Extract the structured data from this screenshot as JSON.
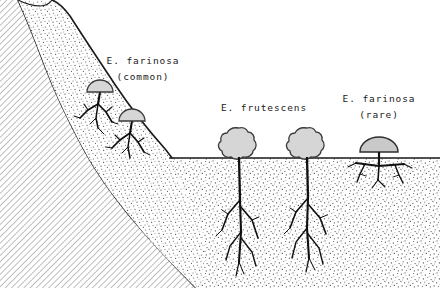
{
  "figure": {
    "width": 440,
    "height": 288,
    "background_color": "#ffffff"
  },
  "colors": {
    "ink": "#1a1a1a",
    "bedrock_hatch": "#8c8c8c",
    "soil_stipple": "#4a4a4a",
    "shrub_fill": "#d6d6d6",
    "shrub_outline": "#3a3a3a",
    "root_color": "#101010",
    "ground_line": "#1a1a1a"
  },
  "labels": [
    {
      "id": "slope-species",
      "species": "E. farinosa",
      "qualifier": "(common)",
      "x": 143,
      "y_species": 61,
      "y_qualifier": 77
    },
    {
      "id": "flat-deep-root-species",
      "species": "E. frutescens",
      "qualifier": "",
      "x": 264,
      "y_species": 108,
      "y_qualifier": 0
    },
    {
      "id": "flat-shallow-root-species",
      "species": "E. farinosa",
      "qualifier": "(rare)",
      "x": 379,
      "y_species": 99,
      "y_qualifier": 115
    }
  ],
  "terrain": {
    "bedrock_label": "bedrock",
    "soil_label": "soil",
    "ground_surface_y": 158,
    "slope_description": "steep rocky slope descending from upper-left to valley floor at right",
    "soil_mantle_thickness_slope": "thin",
    "soil_thickness_flat": "deep"
  },
  "plants": [
    {
      "id": "slope-shrub-upper",
      "species": "E. farinosa",
      "canopy_shape": "dome",
      "root_type": "shallow-branching",
      "cx": 100,
      "cy": 82,
      "rx": 13,
      "ry": 11
    },
    {
      "id": "slope-shrub-lower",
      "species": "E. farinosa",
      "canopy_shape": "dome",
      "root_type": "shallow-branching",
      "cx": 132,
      "cy": 111,
      "rx": 13,
      "ry": 11
    },
    {
      "id": "flat-shrub-left",
      "species": "E. frutescens",
      "canopy_shape": "bushy-round",
      "root_type": "deep-taproot",
      "cx": 239,
      "cy": 142,
      "rx": 17,
      "ry": 15
    },
    {
      "id": "flat-shrub-right",
      "species": "E. frutescens",
      "canopy_shape": "bushy-round",
      "root_type": "deep-taproot",
      "cx": 307,
      "cy": 142,
      "rx": 17,
      "ry": 15
    },
    {
      "id": "flat-shrub-rare",
      "species": "E. farinosa",
      "canopy_shape": "half-dome",
      "root_type": "shallow-lateral",
      "cx": 379,
      "cy": 152,
      "rx": 19,
      "ry": 15
    }
  ]
}
